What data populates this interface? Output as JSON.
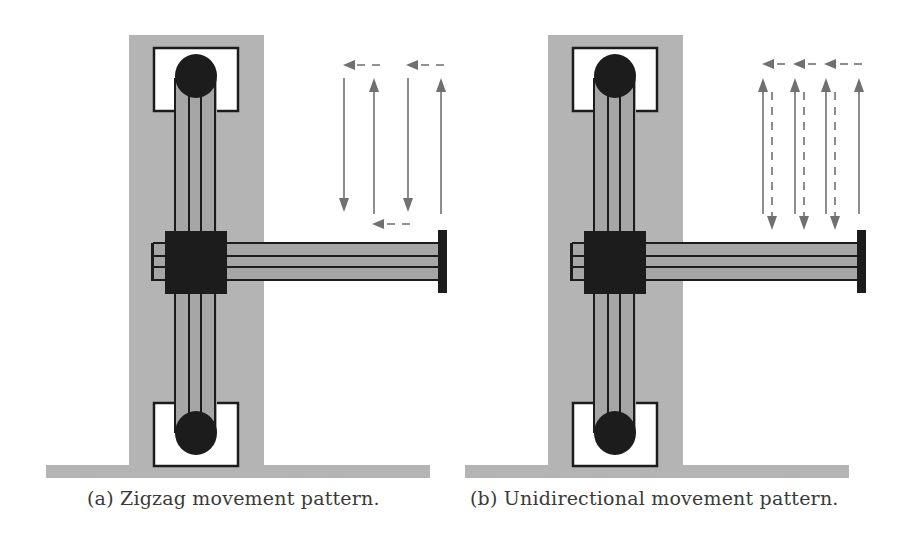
{
  "colors": {
    "frame_gray": "#b4b4b4",
    "belt_gray": "#a6a6a6",
    "dark": "#1c1c1c",
    "arrow_gray": "#707070",
    "background": "#ffffff"
  },
  "panels": [
    {
      "id": "a",
      "caption": "(a) Zigzag movement pattern.",
      "pattern": "zigzag",
      "offset_x": 0,
      "arrows": [
        {
          "type": "solid",
          "dir": "down",
          "x": 344,
          "y1": 78,
          "y2": 212
        },
        {
          "type": "solid",
          "dir": "up",
          "x": 374,
          "y1": 214,
          "y2": 78
        },
        {
          "type": "solid",
          "dir": "down",
          "x": 408,
          "y1": 78,
          "y2": 212
        },
        {
          "type": "solid",
          "dir": "up",
          "x": 441,
          "y1": 214,
          "y2": 78
        },
        {
          "type": "dashed",
          "dir": "left",
          "y": 65,
          "x1": 380,
          "x2": 343
        },
        {
          "type": "dashed",
          "dir": "left",
          "y": 65,
          "x1": 444,
          "x2": 406
        },
        {
          "type": "dashed",
          "dir": "left",
          "y": 224,
          "x1": 410,
          "x2": 372
        }
      ]
    },
    {
      "id": "b",
      "caption": "(b) Unidirectional movement pattern.",
      "pattern": "unidirectional",
      "offset_x": 419,
      "arrows": [
        {
          "type": "solid",
          "dir": "up",
          "x": 763,
          "y1": 214,
          "y2": 78
        },
        {
          "type": "solid",
          "dir": "up",
          "x": 795,
          "y1": 214,
          "y2": 78
        },
        {
          "type": "solid",
          "dir": "up",
          "x": 826,
          "y1": 214,
          "y2": 78
        },
        {
          "type": "solid",
          "dir": "up",
          "x": 859,
          "y1": 214,
          "y2": 78
        },
        {
          "type": "dashed",
          "dir": "down",
          "x": 772,
          "y1": 92,
          "y2": 230
        },
        {
          "type": "dashed",
          "dir": "down",
          "x": 804,
          "y1": 92,
          "y2": 230
        },
        {
          "type": "dashed",
          "dir": "down",
          "x": 835,
          "y1": 92,
          "y2": 230
        },
        {
          "type": "dashed",
          "dir": "left",
          "y": 64,
          "x1": 785,
          "x2": 762
        },
        {
          "type": "dashed",
          "dir": "left",
          "y": 64,
          "x1": 816,
          "x2": 793
        },
        {
          "type": "dashed",
          "dir": "left",
          "y": 64,
          "x1": 848,
          "x2": 824
        },
        {
          "type": "dashed",
          "dir": "none",
          "y": 64,
          "x1": 852,
          "x2": 862
        }
      ]
    }
  ]
}
